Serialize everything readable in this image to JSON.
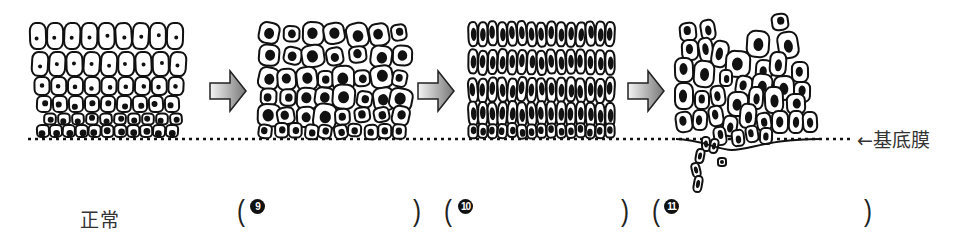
{
  "stages": [
    {
      "id": "normal",
      "label": "正常",
      "style": "cells with small nuclei, flattening toward top"
    },
    {
      "id": "stage9",
      "blank_number": "9",
      "answer_blank": "",
      "style": "enlarged nuclei, irregular sizes"
    },
    {
      "id": "stage10",
      "blank_number": "10",
      "answer_blank": "",
      "style": "densely packed elongated cells, full thickness atypia"
    },
    {
      "id": "stage11",
      "blank_number": "11",
      "answer_blank": "",
      "style": "atypical cells breaking through basement membrane"
    }
  ],
  "basement_membrane_label": "←基底膜",
  "arrows": 3,
  "colors": {
    "line": "#111111",
    "arrow_light": "#f4f4f4",
    "arrow_dark": "#7a7a7a",
    "text": "#333333"
  }
}
